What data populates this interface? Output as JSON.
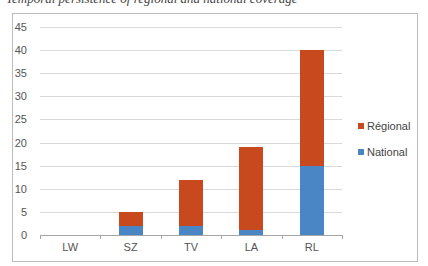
{
  "caption": "Temporal persistence of regional and national coverage",
  "chart_data": {
    "type": "bar",
    "stacked": true,
    "title": "",
    "xlabel": "",
    "ylabel": "",
    "categories": [
      "LW",
      "SZ",
      "TV",
      "LA",
      "RL"
    ],
    "series": [
      {
        "name": "National",
        "color": "#4f81bd",
        "values": [
          0,
          2,
          2,
          1,
          15
        ]
      },
      {
        "name": "Régional",
        "color": "#c0504d",
        "values": [
          0,
          3,
          10,
          18,
          25
        ]
      }
    ],
    "totals": [
      0,
      5,
      12,
      19,
      40
    ],
    "ylim": [
      0,
      45
    ],
    "yticks": [
      0,
      5,
      10,
      15,
      20,
      25,
      30,
      35,
      40,
      45
    ],
    "grid": true,
    "legend_position": "right",
    "legend": [
      "Régional",
      "National"
    ]
  },
  "colors": {
    "regional": "#c9491f",
    "national": "#4a86c6"
  }
}
